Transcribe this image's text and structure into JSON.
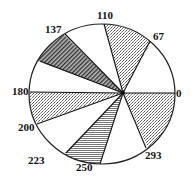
{
  "diagram": {
    "type": "angular-sector-diagram",
    "hub": [
      123,
      93
    ],
    "circle": {
      "cx": 102,
      "cy": 94,
      "rx": 73,
      "ry": 70
    },
    "rays": [
      {
        "label": "0",
        "end": [
          175,
          93
        ],
        "label_pos": [
          176,
          97
        ]
      },
      {
        "label": "67",
        "end": [
          150,
          41
        ],
        "label_pos": [
          153,
          40
        ]
      },
      {
        "label": "110",
        "end": [
          104,
          24
        ],
        "label_pos": [
          97,
          19
        ]
      },
      {
        "label": "137",
        "end": [
          65,
          34
        ],
        "label_pos": [
          45,
          33
        ]
      },
      {
        "label": "",
        "end": [
          40,
          61
        ],
        "label_pos": [
          0,
          0
        ]
      },
      {
        "label": "180",
        "end": [
          30,
          92
        ],
        "label_pos": [
          12,
          95
        ]
      },
      {
        "label": "200",
        "end": [
          37,
          124
        ],
        "label_pos": [
          18,
          131
        ]
      },
      {
        "label": "223",
        "end": [
          66,
          153
        ],
        "label_pos": [
          28,
          164
        ]
      },
      {
        "label": "250",
        "end": [
          100,
          164
        ],
        "label_pos": [
          76,
          171
        ]
      },
      {
        "label": "293",
        "end": [
          146,
          148
        ],
        "label_pos": [
          145,
          159
        ]
      }
    ],
    "sectors": [
      {
        "from": "67",
        "to": "110",
        "fill": "dots"
      },
      {
        "from": "137",
        "to": "",
        "fill": "hatch"
      },
      {
        "from": "180",
        "to": "200",
        "fill": "dots"
      },
      {
        "from": "223",
        "to": "250",
        "fill": "lines"
      },
      {
        "from": "293",
        "to": "0",
        "fill": "dots"
      }
    ],
    "labels": [
      "0",
      "67",
      "110",
      "137",
      "180",
      "200",
      "223",
      "250",
      "293"
    ]
  }
}
